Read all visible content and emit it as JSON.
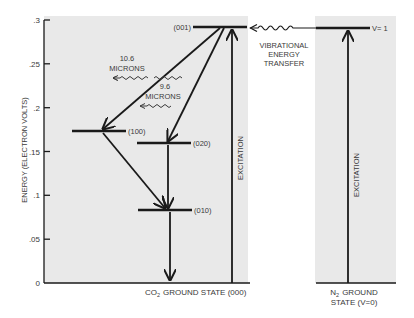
{
  "colors": {
    "panel": "#e9e9e9",
    "line": "#1a1a1a",
    "text": "#3a3a3a",
    "background": "#ffffff"
  },
  "axis": {
    "label": "ENERGY (ELECTRON VOLTS)",
    "ticks": [
      ".3",
      ".25",
      ".2",
      ".15",
      ".1",
      ".05",
      "0"
    ],
    "range": [
      0,
      0.3
    ]
  },
  "co2": {
    "levels": [
      {
        "label": "(001)",
        "energy": 0.29
      },
      {
        "label": "(100)",
        "energy": 0.173
      },
      {
        "label": "(020)",
        "energy": 0.16
      },
      {
        "label": "(010)",
        "energy": 0.083
      }
    ],
    "emissions": [
      {
        "line1": "10.6",
        "line2": "MICRONS",
        "from": "(001)",
        "to": "(100)"
      },
      {
        "line1": "9.6",
        "line2": "MICRONS",
        "from": "(001)",
        "to": "(020)"
      }
    ],
    "excitation_label": "EXCITATION",
    "ground_prefix": "CO",
    "ground_sub": "2",
    "ground_suffix": "GROUND STATE (000)"
  },
  "transfer": {
    "line1": "VIBRATIONAL",
    "line2": "ENERGY",
    "line3": "TRANSFER"
  },
  "n2": {
    "level_label": "V= 1",
    "level_energy": 0.29,
    "excitation_label": "EXCITATION",
    "ground_prefix": "N",
    "ground_sub": "2",
    "ground_line1_suffix": "GROUND",
    "ground_line2": "STATE (V=0)"
  }
}
